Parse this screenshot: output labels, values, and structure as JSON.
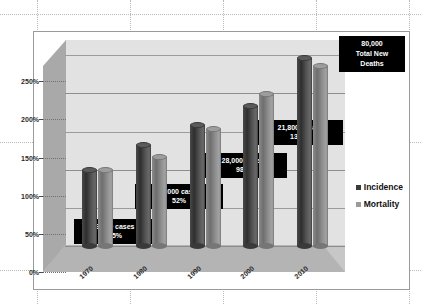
{
  "chart_data": {
    "type": "bar",
    "title": "",
    "xlabel": "",
    "ylabel": "",
    "categories": [
      "1970",
      "1980",
      "1990",
      "2000",
      "2010"
    ],
    "ylim": [
      0,
      270
    ],
    "yticks": [
      "0%",
      "50%",
      "100%",
      "150%",
      "200%",
      "250%"
    ],
    "ytick_values": [
      0,
      50,
      100,
      150,
      200,
      250
    ],
    "grid": true,
    "legend_position": "right",
    "series": [
      {
        "name": "Incidence",
        "color": "#3a3a3a",
        "values": [
          104,
          136,
          162,
          187,
          250
        ]
      },
      {
        "name": "Mortality",
        "color": "#7a7a7a",
        "values": [
          104,
          121,
          157,
          203,
          240
        ]
      }
    ],
    "annotations": [
      {
        "id": "callout-1970",
        "line1": "9,000 cases",
        "line2": "15%"
      },
      {
        "id": "callout-1980",
        "line1": "23,000 cases",
        "line2": "52%"
      },
      {
        "id": "callout-1990",
        "line1": "28,000 cases",
        "line2": "98%"
      },
      {
        "id": "callout-2000",
        "line1": "21,800 cases",
        "line2": "134%"
      }
    ],
    "summary_box": {
      "line1": "80,000",
      "line2": "Total New",
      "line3": "Deaths"
    }
  },
  "legend": {
    "items": [
      {
        "label": "Incidence",
        "color": "#3a3a3a"
      },
      {
        "label": "Mortality",
        "color": "#9b9b9b"
      }
    ]
  },
  "colors": {
    "plot_wall": "#e2e2e2",
    "side_wall": "#a9a9a9",
    "floor": "#b4b4b4",
    "frame_border": "#9a9a9a",
    "callout_bg": "#000000",
    "callout_fg": "#ffffff",
    "guide_line": "#b9b9b9",
    "page_background": "#ffffff"
  }
}
